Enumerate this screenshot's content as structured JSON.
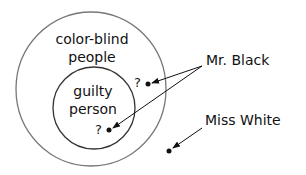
{
  "diagram": {
    "outer_set": {
      "label_line1": "color-blind",
      "label_line2": "people"
    },
    "inner_set": {
      "label_line1": "guilty",
      "label_line2": "person"
    },
    "question_mark_outer": "?",
    "question_mark_inner": "?",
    "mr_black": {
      "label": "Mr. Black"
    },
    "miss_white": {
      "label": "Miss White"
    }
  }
}
